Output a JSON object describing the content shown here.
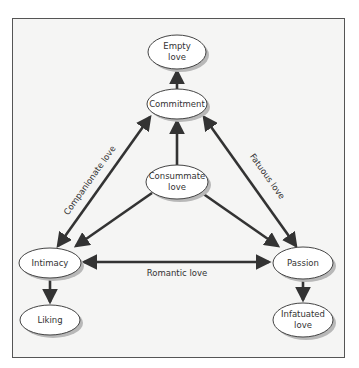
{
  "diagram": {
    "colors": {
      "background": "#f5f5f4",
      "frame_border": "#555555",
      "node_fill": "#ffffff",
      "node_stroke": "#444444",
      "node_shadow": "#b8b8b8",
      "edge": "#333333",
      "text": "#333333"
    },
    "nodes": [
      {
        "id": "empty",
        "lines": [
          "Empty",
          "love"
        ],
        "cx": 177,
        "cy": 52,
        "rx": 29,
        "ry": 17
      },
      {
        "id": "commitment",
        "lines": [
          "Commitment"
        ],
        "cx": 177,
        "cy": 104,
        "rx": 30,
        "ry": 15
      },
      {
        "id": "consummate",
        "lines": [
          "Consummate",
          "love"
        ],
        "cx": 177,
        "cy": 182,
        "rx": 31,
        "ry": 17
      },
      {
        "id": "intimacy",
        "lines": [
          "Intimacy"
        ],
        "cx": 50,
        "cy": 263,
        "rx": 31,
        "ry": 15
      },
      {
        "id": "passion",
        "lines": [
          "Passion"
        ],
        "cx": 303,
        "cy": 263,
        "rx": 30,
        "ry": 16
      },
      {
        "id": "liking",
        "lines": [
          "Liking"
        ],
        "cx": 50,
        "cy": 320,
        "rx": 30,
        "ry": 15
      },
      {
        "id": "infatuated",
        "lines": [
          "Infatuated",
          "love"
        ],
        "cx": 303,
        "cy": 320,
        "rx": 30,
        "ry": 17
      }
    ],
    "edges": [
      {
        "from": "commitment",
        "to": "empty",
        "type": "single"
      },
      {
        "from": "consummate",
        "to": "commitment",
        "type": "single"
      },
      {
        "from": "consummate",
        "to": "intimacy",
        "type": "single"
      },
      {
        "from": "consummate",
        "to": "passion",
        "type": "single"
      },
      {
        "from": "intimacy",
        "to": "commitment",
        "type": "double",
        "label": "Companionate love"
      },
      {
        "from": "passion",
        "to": "commitment",
        "type": "double",
        "label": "Fatuous love"
      },
      {
        "from": "intimacy",
        "to": "passion",
        "type": "double",
        "label": "Romantic love"
      },
      {
        "from": "intimacy",
        "to": "liking",
        "type": "single"
      },
      {
        "from": "passion",
        "to": "infatuated",
        "type": "single"
      }
    ],
    "labels": {
      "companionate": "Companionate love",
      "fatuous": "Fatuous love",
      "romantic": "Romantic love"
    }
  }
}
